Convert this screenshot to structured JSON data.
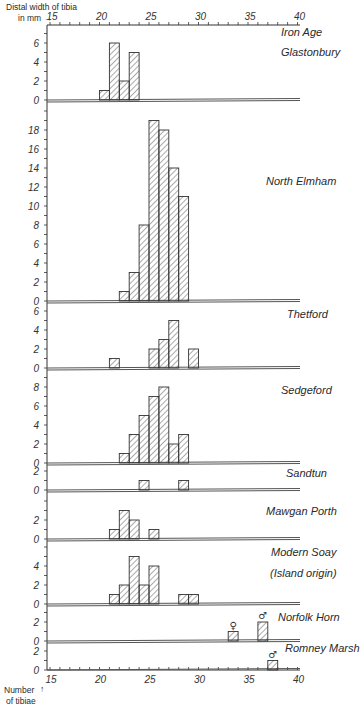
{
  "chart_data": {
    "type": "bar",
    "subtype": "stacked-panel-histograms",
    "x_axis": {
      "title_line1": "Distal width of tibia",
      "title_line2": "in mm →",
      "range": [
        15,
        40
      ],
      "tick_labels": [
        "15",
        "20",
        "25",
        "30",
        "35",
        "40"
      ],
      "tick_values": [
        15,
        20,
        25,
        30,
        35,
        40
      ],
      "minor_tick_step": 1
    },
    "y_axis": {
      "title_line1": "Number",
      "title_line2": "of tibiae",
      "arrow": "↑"
    },
    "bin_width_mm": 1,
    "panels": [
      {
        "name": "Iron Age Glastonbury",
        "label_lines": [
          "Iron Age",
          "Glastonbury"
        ],
        "ymax": 7,
        "y_tick_labels": [
          "0",
          "2",
          "4",
          "6"
        ],
        "bins": [
          {
            "x": 20,
            "count": 1
          },
          {
            "x": 21,
            "count": 6
          },
          {
            "x": 22,
            "count": 2
          },
          {
            "x": 23,
            "count": 5
          }
        ]
      },
      {
        "name": "North Elmham",
        "label_lines": [
          "North Elmham"
        ],
        "ymax": 20,
        "y_tick_labels": [
          "0",
          "2",
          "4",
          "6",
          "8",
          "10",
          "12",
          "14",
          "16",
          "18"
        ],
        "bins": [
          {
            "x": 22,
            "count": 1
          },
          {
            "x": 23,
            "count": 3
          },
          {
            "x": 24,
            "count": 8
          },
          {
            "x": 25,
            "count": 19
          },
          {
            "x": 26,
            "count": 18
          },
          {
            "x": 27,
            "count": 14
          },
          {
            "x": 28,
            "count": 11
          }
        ]
      },
      {
        "name": "Thetford",
        "label_lines": [
          "Thetford"
        ],
        "ymax": 6,
        "y_tick_labels": [
          "0",
          "2",
          "4",
          "6"
        ],
        "bins": [
          {
            "x": 21,
            "count": 1
          },
          {
            "x": 25,
            "count": 2
          },
          {
            "x": 26,
            "count": 3
          },
          {
            "x": 27,
            "count": 5
          },
          {
            "x": 29,
            "count": 2
          }
        ]
      },
      {
        "name": "Sedgeford",
        "label_lines": [
          "Sedgeford"
        ],
        "ymax": 9,
        "y_tick_labels": [
          "0",
          "2",
          "4",
          "6",
          "8"
        ],
        "bins": [
          {
            "x": 22,
            "count": 1
          },
          {
            "x": 23,
            "count": 3
          },
          {
            "x": 24,
            "count": 5
          },
          {
            "x": 25,
            "count": 7
          },
          {
            "x": 26,
            "count": 8
          },
          {
            "x": 27,
            "count": 2
          },
          {
            "x": 28,
            "count": 3
          }
        ]
      },
      {
        "name": "Sandtun",
        "label_lines": [
          "Sandtun"
        ],
        "ymax": 2,
        "y_tick_labels": [
          "0",
          "2"
        ],
        "bins": [
          {
            "x": 24,
            "count": 1
          },
          {
            "x": 28,
            "count": 1
          }
        ]
      },
      {
        "name": "Mawgan Porth",
        "label_lines": [
          "Mawgan Porth"
        ],
        "ymax": 4,
        "y_tick_labels": [
          "0",
          "2"
        ],
        "bins": [
          {
            "x": 21,
            "count": 1
          },
          {
            "x": 22,
            "count": 3
          },
          {
            "x": 23,
            "count": 2
          },
          {
            "x": 25,
            "count": 1
          }
        ]
      },
      {
        "name": "Modern Soay (Island origin)",
        "label_lines": [
          "Modern Soay",
          "(Island origin)"
        ],
        "ymax": 6,
        "y_tick_labels": [
          "0",
          "2",
          "4"
        ],
        "bins": [
          {
            "x": 21,
            "count": 1
          },
          {
            "x": 22,
            "count": 2
          },
          {
            "x": 23,
            "count": 5
          },
          {
            "x": 24,
            "count": 2
          },
          {
            "x": 25,
            "count": 4
          },
          {
            "x": 28,
            "count": 1
          },
          {
            "x": 29,
            "count": 1
          }
        ]
      },
      {
        "name": "Norfolk Horn",
        "label_lines": [
          "Norfolk Horn"
        ],
        "ymax": 3,
        "y_tick_labels": [
          "0",
          "2"
        ],
        "bins": [
          {
            "x": 33,
            "count": 1,
            "sex": "♀"
          },
          {
            "x": 36,
            "count": 2,
            "sex": "♂"
          }
        ]
      },
      {
        "name": "Romney Marsh",
        "label_lines": [
          "Romney Marsh"
        ],
        "ymax": 2,
        "y_tick_labels": [
          "0",
          "2"
        ],
        "bins": [
          {
            "x": 37,
            "count": 1,
            "sex": "♂"
          }
        ]
      }
    ]
  },
  "colors": {
    "ink": "#2a2a2a",
    "hatch": "#444444",
    "baseline": "#555555",
    "background": "#ffffff"
  }
}
